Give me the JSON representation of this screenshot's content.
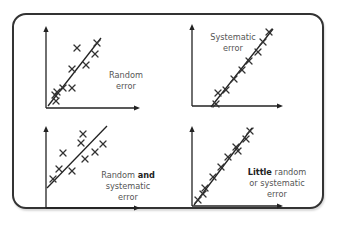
{
  "diagram": {
    "colors": {
      "frame": "#333333",
      "ink": "#222222",
      "label": "#555555",
      "background": "#ffffff"
    },
    "panels": [
      {
        "id": "random-error",
        "axes": {
          "origin": [
            46,
            108
          ],
          "y_top": 26,
          "x_right": 140
        },
        "fit_line": [
          [
            48,
            106
          ],
          [
            101,
            38
          ]
        ],
        "marks": [
          [
            56,
            101
          ],
          [
            57,
            92
          ],
          [
            63,
            88
          ],
          [
            72,
            88
          ],
          [
            72,
            69
          ],
          [
            86,
            65
          ],
          [
            77,
            48
          ],
          [
            95,
            54
          ],
          [
            97,
            43
          ],
          [
            55,
            95
          ]
        ],
        "label_lines": [
          [
            {
              "text": "Random",
              "bold": false
            }
          ],
          [
            {
              "text": "error",
              "bold": false
            }
          ]
        ],
        "label_x": 126,
        "label_y": [
          78,
          89
        ]
      },
      {
        "id": "systematic-error",
        "axes": {
          "origin": [
            192,
            106
          ],
          "y_top": 24,
          "x_right": 283
        },
        "fit_line": [
          [
            211,
            107
          ],
          [
            273,
            29
          ]
        ],
        "marks": [
          [
            216,
            104
          ],
          [
            218,
            93
          ],
          [
            226,
            90
          ],
          [
            234,
            79
          ],
          [
            242,
            70
          ],
          [
            249,
            61
          ],
          [
            258,
            52
          ],
          [
            263,
            42
          ],
          [
            269,
            32
          ]
        ],
        "label_lines": [
          [
            {
              "text": "Systematic",
              "bold": false
            }
          ],
          [
            {
              "text": "error",
              "bold": false
            }
          ]
        ],
        "label_x": 233,
        "label_y": [
          40,
          51
        ]
      },
      {
        "id": "random-and-systematic-error",
        "axes": {
          "origin": [
            46,
            208
          ],
          "y_top": 126,
          "x_right": 140
        },
        "fit_line": [
          [
            47,
            188
          ],
          [
            107,
            126
          ]
        ],
        "marks": [
          [
            53,
            179
          ],
          [
            59,
            169
          ],
          [
            63,
            153
          ],
          [
            72,
            171
          ],
          [
            81,
            143
          ],
          [
            83,
            134
          ],
          [
            85,
            159
          ],
          [
            95,
            152
          ],
          [
            103,
            144
          ]
        ],
        "label_lines": [
          [
            {
              "text": "Random ",
              "bold": false
            },
            {
              "text": "and",
              "bold": true
            }
          ],
          [
            {
              "text": "systematic",
              "bold": false
            }
          ],
          [
            {
              "text": "error",
              "bold": false
            }
          ]
        ],
        "label_x": 128,
        "label_y": [
          178,
          189,
          200
        ]
      },
      {
        "id": "little-error",
        "axes": {
          "origin": [
            192,
            206
          ],
          "y_top": 126,
          "x_right": 283
        },
        "fit_line": [
          [
            194,
            205
          ],
          [
            252,
            128
          ]
        ],
        "marks": [
          [
            198,
            200
          ],
          [
            203,
            194
          ],
          [
            205,
            188
          ],
          [
            213,
            177
          ],
          [
            221,
            167
          ],
          [
            228,
            157
          ],
          [
            236,
            147
          ],
          [
            238,
            151
          ],
          [
            246,
            139
          ],
          [
            250,
            131
          ]
        ],
        "label_lines": [
          [
            {
              "text": "Little",
              "bold": true
            },
            {
              "text": " random",
              "bold": false
            }
          ],
          [
            {
              "text": "or systematic",
              "bold": false
            }
          ],
          [
            {
              "text": "error",
              "bold": false
            }
          ]
        ],
        "label_x": 277,
        "label_y": [
          175,
          186,
          197
        ]
      }
    ]
  }
}
